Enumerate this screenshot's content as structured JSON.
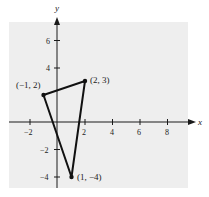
{
  "figure": {
    "background_color": "#eeeeee",
    "axis_color": "#1a1a1a",
    "triangle_color": "#111111",
    "axes": {
      "x_label": "x",
      "y_label": "y",
      "x_ticks": [
        "−2",
        "2",
        "4",
        "6",
        "8"
      ],
      "y_ticks": [
        "6",
        "4",
        "−2",
        "−4"
      ]
    },
    "points": [
      {
        "label": "(−1, 2)",
        "x": -1,
        "y": 2
      },
      {
        "label": "(2, 3)",
        "x": 2,
        "y": 3
      },
      {
        "label": "(1, −4)",
        "x": 1,
        "y": -4
      }
    ]
  }
}
